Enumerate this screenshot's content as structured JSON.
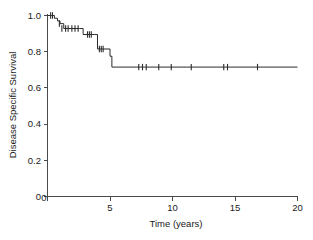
{
  "chart_data": {
    "type": "line",
    "subtype": "kaplan-meier-step",
    "title": "",
    "subtitle": "",
    "xlabel": "Time (years)",
    "ylabel": "Disease Specific Survival",
    "xlim": [
      0,
      20
    ],
    "ylim": [
      0,
      1.0
    ],
    "xticks": [
      0,
      5,
      10,
      15,
      20
    ],
    "xtick_labels": [
      "0",
      "5",
      "10",
      "15",
      "20"
    ],
    "yticks": [
      0,
      0.2,
      0.4,
      0.6,
      0.8,
      1.0
    ],
    "ytick_labels": [
      "0",
      "0.2",
      "0.4",
      "0.6",
      "0.8",
      "1.0"
    ],
    "grid": false,
    "legend": false,
    "legend_position": "none",
    "line_color": "#2b2b2b",
    "axis_color": "#4a4a4a",
    "background_color": "#ffffff",
    "series": [
      {
        "name": "Disease Specific Survival",
        "x": [
          0.0,
          0.35,
          0.55,
          0.8,
          1.0,
          1.3,
          2.55,
          2.85,
          3.75,
          4.0,
          4.6,
          5.0,
          5.15,
          20.0
        ],
        "y": [
          1.0,
          1.0,
          0.985,
          0.97,
          0.955,
          0.928,
          0.928,
          0.895,
          0.895,
          0.815,
          0.815,
          0.775,
          0.715,
          0.715
        ]
      }
    ],
    "censor_times": [
      0.25,
      0.4,
      0.95,
      1.15,
      1.45,
      1.65,
      1.95,
      2.2,
      2.45,
      3.2,
      3.35,
      3.5,
      4.15,
      4.3,
      4.45,
      7.3,
      7.6,
      7.9,
      8.9,
      9.9,
      11.5,
      14.1,
      14.4,
      16.8
    ],
    "censor_survival": [
      1.0,
      1.0,
      0.955,
      0.928,
      0.928,
      0.928,
      0.928,
      0.928,
      0.928,
      0.895,
      0.895,
      0.895,
      0.815,
      0.815,
      0.815,
      0.715,
      0.715,
      0.715,
      0.715,
      0.715,
      0.715,
      0.715,
      0.715,
      0.715
    ],
    "plateau_value": 0.715
  },
  "axes": {
    "x_title": "Time (years)",
    "y_title": "Disease Specific Survival",
    "x_tick_0": "0",
    "x_tick_1": "5",
    "x_tick_2": "10",
    "x_tick_3": "15",
    "x_tick_4": "20",
    "y_tick_0": "0",
    "y_tick_1": "0.2",
    "y_tick_2": "0.4",
    "y_tick_3": "0.6",
    "y_tick_4": "0.8",
    "y_tick_5": "1.0"
  }
}
